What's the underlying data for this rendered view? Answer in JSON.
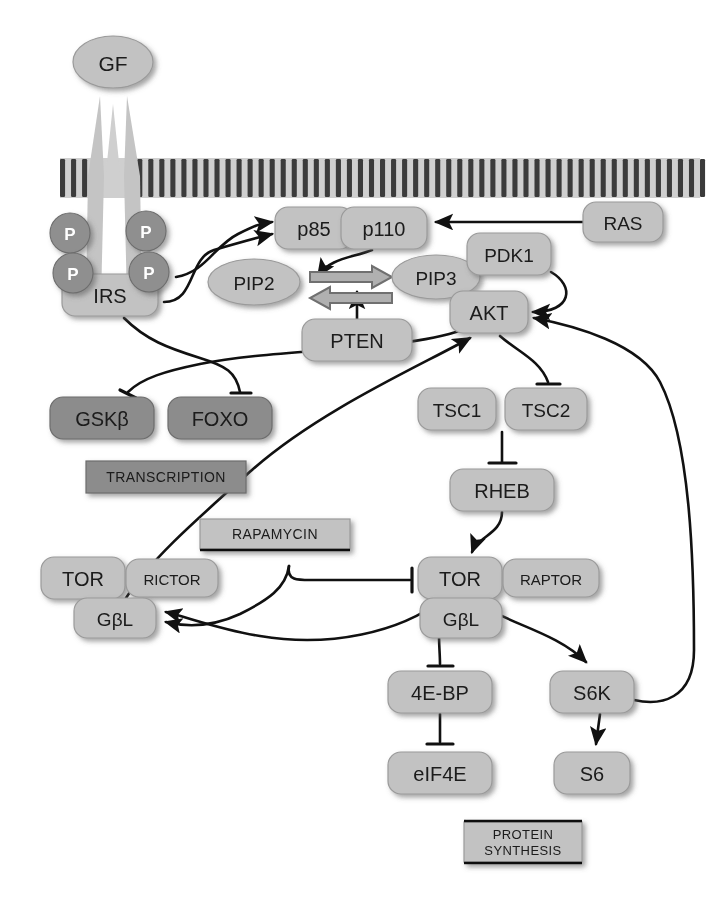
{
  "diagram": {
    "background": "#ffffff",
    "colors": {
      "node_light": "#c2c2c2",
      "node_light_edge": "#9a9a9a",
      "node_dark": "#8c8c8c",
      "node_dark_edge": "#6d6d6d",
      "phospho_circle": "#8f8f8f",
      "membrane": "#3a3a3a",
      "receptor": "#bcbcbc",
      "line": "#111111",
      "block_arrow_fill": "#b0b0b0",
      "block_arrow_edge": "#6f6f6f",
      "text_dark": "#1a1a1a",
      "text_light": "#ffffff"
    },
    "membrane": {
      "name": "plasma-membrane",
      "y_top": 158,
      "y_bottom": 198,
      "x_start": 60,
      "x_end": 700,
      "stripe_count": 58
    },
    "nodes": [
      {
        "id": "gf",
        "label": "GF",
        "shape": "ellipse",
        "x": 113,
        "y": 62,
        "w": 80,
        "h": 52,
        "tone": "light",
        "font": 21
      },
      {
        "id": "irs",
        "label": "IRS",
        "shape": "rrect",
        "x": 110,
        "y": 295,
        "w": 96,
        "h": 42,
        "tone": "light",
        "font": 20
      },
      {
        "id": "p85",
        "label": "p85",
        "shape": "rrect",
        "x": 314,
        "y": 228,
        "w": 78,
        "h": 42,
        "tone": "light",
        "font": 20
      },
      {
        "id": "p110",
        "label": "p110",
        "shape": "rrect",
        "x": 384,
        "y": 228,
        "w": 86,
        "h": 42,
        "tone": "light",
        "font": 20
      },
      {
        "id": "ras",
        "label": "RAS",
        "shape": "rrect",
        "x": 623,
        "y": 222,
        "w": 80,
        "h": 40,
        "tone": "light",
        "font": 19
      },
      {
        "id": "pip2",
        "label": "PIP2",
        "shape": "ellipse",
        "x": 254,
        "y": 282,
        "w": 92,
        "h": 46,
        "tone": "light",
        "font": 19
      },
      {
        "id": "pip3",
        "label": "PIP3",
        "shape": "ellipse",
        "x": 436,
        "y": 277,
        "w": 88,
        "h": 44,
        "tone": "light",
        "font": 19
      },
      {
        "id": "pdk1",
        "label": "PDK1",
        "shape": "rrect",
        "x": 509,
        "y": 254,
        "w": 84,
        "h": 42,
        "tone": "light",
        "font": 19
      },
      {
        "id": "akt",
        "label": "AKT",
        "shape": "rrect",
        "x": 489,
        "y": 312,
        "w": 78,
        "h": 42,
        "tone": "light",
        "font": 20
      },
      {
        "id": "pten",
        "label": "PTEN",
        "shape": "rrect",
        "x": 357,
        "y": 340,
        "w": 110,
        "h": 42,
        "tone": "light",
        "font": 20
      },
      {
        "id": "gsk",
        "label": "GSKβ",
        "shape": "rrect",
        "x": 102,
        "y": 418,
        "w": 104,
        "h": 42,
        "tone": "dark",
        "font": 20
      },
      {
        "id": "foxo",
        "label": "FOXO",
        "shape": "rrect",
        "x": 220,
        "y": 418,
        "w": 104,
        "h": 42,
        "tone": "dark",
        "font": 20
      },
      {
        "id": "tsc1",
        "label": "TSC1",
        "shape": "rrect",
        "x": 457,
        "y": 409,
        "w": 78,
        "h": 42,
        "tone": "light",
        "font": 19
      },
      {
        "id": "tsc2",
        "label": "TSC2",
        "shape": "rrect",
        "x": 546,
        "y": 409,
        "w": 82,
        "h": 42,
        "tone": "light",
        "font": 19
      },
      {
        "id": "rheb",
        "label": "RHEB",
        "shape": "rrect",
        "x": 502,
        "y": 490,
        "w": 104,
        "h": 42,
        "tone": "light",
        "font": 20
      },
      {
        "id": "tor2",
        "label": "TOR",
        "shape": "rrect",
        "x": 83,
        "y": 578,
        "w": 84,
        "h": 42,
        "tone": "light",
        "font": 20
      },
      {
        "id": "rictor",
        "label": "RICTOR",
        "shape": "rrect",
        "x": 172,
        "y": 578,
        "w": 92,
        "h": 38,
        "tone": "light",
        "font": 15
      },
      {
        "id": "gbl2",
        "label": "GβL",
        "shape": "rrect",
        "x": 115,
        "y": 618,
        "w": 82,
        "h": 40,
        "tone": "light",
        "font": 19
      },
      {
        "id": "tor1",
        "label": "TOR",
        "shape": "rrect",
        "x": 460,
        "y": 578,
        "w": 84,
        "h": 42,
        "tone": "light",
        "font": 20
      },
      {
        "id": "raptor",
        "label": "RAPTOR",
        "shape": "rrect",
        "x": 551,
        "y": 578,
        "w": 96,
        "h": 38,
        "tone": "light",
        "font": 15
      },
      {
        "id": "gbl1",
        "label": "GβL",
        "shape": "rrect",
        "x": 461,
        "y": 618,
        "w": 82,
        "h": 40,
        "tone": "light",
        "font": 19
      },
      {
        "id": "4ebp",
        "label": "4E-BP",
        "shape": "rrect",
        "x": 440,
        "y": 692,
        "w": 104,
        "h": 42,
        "tone": "light",
        "font": 20
      },
      {
        "id": "eif4e",
        "label": "eIF4E",
        "shape": "rrect",
        "x": 440,
        "y": 773,
        "w": 104,
        "h": 42,
        "tone": "light",
        "font": 20
      },
      {
        "id": "s6k",
        "label": "S6K",
        "shape": "rrect",
        "x": 592,
        "y": 692,
        "w": 84,
        "h": 42,
        "tone": "light",
        "font": 20
      },
      {
        "id": "s6",
        "label": "S6",
        "shape": "rrect",
        "x": 592,
        "y": 773,
        "w": 76,
        "h": 42,
        "tone": "light",
        "font": 20
      }
    ],
    "boxes": [
      {
        "id": "rapamycin",
        "label": "RAPAMYCIN",
        "x": 275,
        "y": 534,
        "w": 150,
        "h": 30,
        "tone": "light",
        "font": 14,
        "rule": "bottom"
      },
      {
        "id": "transcription",
        "label": "TRANSCRIPTION",
        "x": 166,
        "y": 477,
        "w": 160,
        "h": 32,
        "tone": "dark",
        "font": 14,
        "rule": "none"
      },
      {
        "id": "protein_synthesis",
        "label": "PROTEIN\nSYNTHESIS",
        "x": 523,
        "y": 842,
        "w": 118,
        "h": 40,
        "tone": "light",
        "font": 13,
        "rule": "both"
      }
    ],
    "phospho_sites": [
      {
        "id": "p-tl",
        "label": "P",
        "x": 70,
        "y": 233,
        "r": 20
      },
      {
        "id": "p-tr",
        "label": "P",
        "x": 146,
        "y": 231,
        "r": 20
      },
      {
        "id": "p-bl",
        "label": "P",
        "x": 73,
        "y": 273,
        "r": 20
      },
      {
        "id": "p-br",
        "label": "P",
        "x": 149,
        "y": 272,
        "r": 20
      }
    ],
    "edges": [
      {
        "id": "irs-to-p85",
        "from": "IRS",
        "to": "p85/p110",
        "kind": "activate"
      },
      {
        "id": "irs-to-pi3k-2",
        "from": "IRS",
        "to": "p85/p110",
        "kind": "activate"
      },
      {
        "id": "ras-to-p110",
        "from": "RAS",
        "to": "p110",
        "kind": "activate"
      },
      {
        "id": "p110-to-pip",
        "from": "p110",
        "to": "PIP2-PIP3 conversion",
        "kind": "activate"
      },
      {
        "id": "pten-to-pip",
        "from": "PTEN",
        "to": "PIP3-PIP2 conversion",
        "kind": "activate"
      },
      {
        "id": "pip2-to-pip3",
        "from": "PIP2",
        "to": "PIP3",
        "kind": "block-arrow-right"
      },
      {
        "id": "pip3-to-pip2",
        "from": "PIP3",
        "to": "PIP2",
        "kind": "block-arrow-left"
      },
      {
        "id": "pdk1-to-akt",
        "from": "PDK1",
        "to": "AKT",
        "kind": "activate"
      },
      {
        "id": "akt-to-gsk",
        "from": "AKT",
        "to": "GSKβ",
        "kind": "inhibit"
      },
      {
        "id": "akt-to-foxo",
        "from": "AKT",
        "to": "FOXO",
        "kind": "inhibit"
      },
      {
        "id": "akt-to-tsc2",
        "from": "AKT",
        "to": "TSC2",
        "kind": "inhibit"
      },
      {
        "id": "tsc-to-rheb",
        "from": "TSC1/TSC2",
        "to": "RHEB",
        "kind": "inhibit"
      },
      {
        "id": "rheb-to-tor1",
        "from": "RHEB",
        "to": "TOR/RAPTOR",
        "kind": "activate"
      },
      {
        "id": "rapamycin-to-tor1",
        "from": "RAPAMYCIN",
        "to": "TOR/RAPTOR",
        "kind": "inhibit"
      },
      {
        "id": "rapamycin-to-tor2",
        "from": "RAPAMYCIN",
        "to": "TOR/RICTOR",
        "kind": "activate"
      },
      {
        "id": "tor1-to-4ebp",
        "from": "TOR/RAPTOR",
        "to": "4E-BP",
        "kind": "inhibit"
      },
      {
        "id": "tor1-to-s6k",
        "from": "TOR/RAPTOR",
        "to": "S6K",
        "kind": "activate"
      },
      {
        "id": "tor1-to-tor2",
        "from": "TOR/RAPTOR",
        "to": "TOR/RICTOR",
        "kind": "activate"
      },
      {
        "id": "4ebp-to-eif4e",
        "from": "4E-BP",
        "to": "eIF4E",
        "kind": "inhibit"
      },
      {
        "id": "s6k-to-s6",
        "from": "S6K",
        "to": "S6",
        "kind": "activate"
      },
      {
        "id": "s6k-feedback",
        "from": "S6K",
        "to": "AKT",
        "kind": "activate"
      },
      {
        "id": "tor2-to-akt",
        "from": "TOR/RICTOR",
        "to": "AKT",
        "kind": "activate"
      }
    ]
  }
}
